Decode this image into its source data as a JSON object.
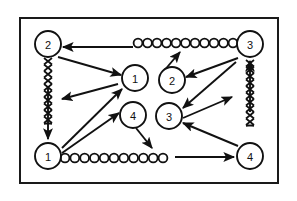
{
  "figure": {
    "type": "node-link-diagram",
    "background_color": "#ffffff",
    "border_color": "#1a1a1a",
    "stroke_color": "#111111",
    "frame": {
      "x": 20,
      "y": 18,
      "width": 258,
      "height": 165,
      "border_width": 2
    }
  },
  "nodes": [
    {
      "id": "n-top-left",
      "label": "2",
      "cx": 48,
      "cy": 44,
      "r": 13
    },
    {
      "id": "n-top-right",
      "label": "3",
      "cx": 250,
      "cy": 44,
      "r": 13
    },
    {
      "id": "n-center-one",
      "label": "1",
      "cx": 135,
      "cy": 78,
      "r": 13
    },
    {
      "id": "n-center-two",
      "label": "2",
      "cx": 172,
      "cy": 80,
      "r": 13
    },
    {
      "id": "n-center-four",
      "label": "4",
      "cx": 133,
      "cy": 115,
      "r": 13
    },
    {
      "id": "n-center-three",
      "label": "3",
      "cx": 169,
      "cy": 116,
      "r": 13
    },
    {
      "id": "n-bottom-left",
      "label": "1",
      "cx": 48,
      "cy": 156,
      "r": 13
    },
    {
      "id": "n-bottom-right",
      "label": "4",
      "cx": 250,
      "cy": 156,
      "r": 13
    }
  ],
  "arrows": [
    {
      "id": "a-top-horizontal-left",
      "from": [
        133,
        47
      ],
      "to": [
        63,
        47
      ]
    },
    {
      "id": "a-two-to-one",
      "from": [
        58,
        57
      ],
      "to": [
        121,
        75
      ]
    },
    {
      "id": "a-one-to-downleft",
      "from": [
        118,
        84
      ],
      "to": [
        62,
        99
      ]
    },
    {
      "id": "a-bottomleft-to-one",
      "from": [
        62,
        148
      ],
      "to": [
        122,
        89
      ]
    },
    {
      "id": "a-bottomleft-to-four",
      "from": [
        62,
        153
      ],
      "to": [
        119,
        113
      ]
    },
    {
      "id": "a-four-to-downright",
      "from": [
        136,
        128
      ],
      "to": [
        152,
        148
      ]
    },
    {
      "id": "a-two-to-chain",
      "from": [
        163,
        72
      ],
      "to": [
        180,
        52
      ]
    },
    {
      "id": "a-three-to-two",
      "from": [
        238,
        58
      ],
      "to": [
        186,
        77
      ]
    },
    {
      "id": "a-three-to-centerthree",
      "from": [
        236,
        62
      ],
      "to": [
        183,
        108
      ]
    },
    {
      "id": "a-centerthree-to-upright",
      "from": [
        183,
        118
      ],
      "to": [
        232,
        97
      ]
    },
    {
      "id": "a-bottomright-to-three",
      "from": [
        238,
        146
      ],
      "to": [
        183,
        123
      ]
    },
    {
      "id": "a-bottom-horizontal",
      "from": [
        175,
        157
      ],
      "to": [
        234,
        157
      ]
    }
  ],
  "zigzag_links": [
    {
      "id": "z-left",
      "from": [
        48,
        58
      ],
      "to": [
        48,
        140
      ],
      "arrow_end": true,
      "direction": "down"
    },
    {
      "id": "z-right",
      "from": [
        250,
        142
      ],
      "to": [
        250,
        60
      ],
      "arrow_end": true,
      "direction": "up"
    }
  ],
  "bead_chains": [
    {
      "id": "chain-top",
      "x_start": 138,
      "x_end": 233,
      "y": 43,
      "bead_count": 11,
      "bead_radius": 4.4
    },
    {
      "id": "chain-bottom",
      "x_start": 65,
      "x_end": 163,
      "y": 158,
      "bead_count": 11,
      "bead_radius": 4.4
    }
  ]
}
